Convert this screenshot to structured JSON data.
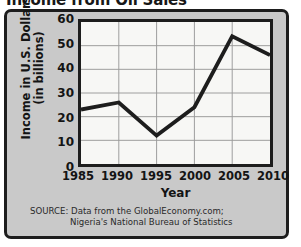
{
  "chart_data": {
    "type": "line",
    "title": "Income from Oil Sales",
    "xlabel": "Year",
    "ylabel": "Income in U.S. Dollars (in billions)",
    "ylabel_line1": "Income in U.S. Dollars",
    "ylabel_line2": "(in billions)",
    "x": [
      1985,
      1990,
      1995,
      2000,
      2005,
      2010
    ],
    "categories": [
      "1985",
      "1990",
      "1995",
      "2000",
      "2005",
      "2010"
    ],
    "values": [
      23,
      26,
      12,
      24,
      54,
      46
    ],
    "series": [
      {
        "name": "Income from Oil Sales",
        "values": [
          23,
          26,
          12,
          24,
          54,
          46
        ]
      }
    ],
    "xlim": [
      1985,
      2010
    ],
    "ylim": [
      0,
      60
    ],
    "yticks": [
      0,
      10,
      20,
      30,
      40,
      50,
      60
    ],
    "ytick_labels": [
      "0",
      "10",
      "20",
      "30",
      "40",
      "50",
      "60"
    ],
    "xticks": [
      1985,
      1990,
      1995,
      2000,
      2005,
      2010
    ],
    "grid": true,
    "legend": false,
    "legend_position": "none",
    "line_color": "#1d1d1d",
    "grid_color": "#9a9a9a",
    "plot_background": "#f7f7f5",
    "panel_background": "#c9c9c9",
    "border_color": "#1d1d1d",
    "source_line1": "SOURCE: Data from the GlobalEconomy.com;",
    "source_line2": "Nigeria's National Bureau of Statistics"
  }
}
